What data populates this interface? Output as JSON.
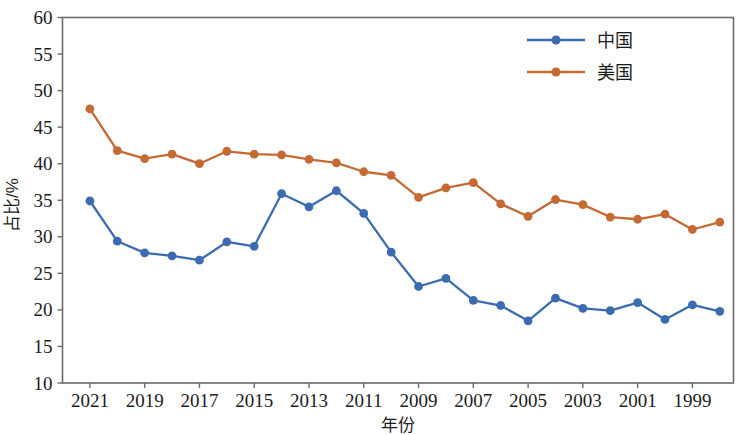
{
  "chart_data": {
    "type": "line",
    "title": "",
    "xlabel": "年份",
    "ylabel": "占比/%",
    "xlim": [
      2022,
      1997.5
    ],
    "ylim": [
      10,
      60
    ],
    "x_reversed": true,
    "grid": false,
    "legend_position": "top-right",
    "y_ticks": [
      60,
      55,
      50,
      45,
      40,
      35,
      30,
      25,
      20,
      15,
      10
    ],
    "x_ticks": [
      2021,
      2019,
      2017,
      2015,
      2013,
      2011,
      2009,
      2007,
      2005,
      2003,
      2001,
      1999
    ],
    "x": [
      2021,
      2020,
      2019,
      2018,
      2017,
      2016,
      2015,
      2014,
      2013,
      2012,
      2011,
      2010,
      2009,
      2008,
      2007,
      2006,
      2005,
      2004,
      2003,
      2002,
      2001,
      2000,
      1999,
      1998
    ],
    "series": [
      {
        "name": "中国",
        "color": "#3c6cb0",
        "marker": "circle",
        "values": [
          34.9,
          29.4,
          27.8,
          27.4,
          26.8,
          29.3,
          28.7,
          35.9,
          34.1,
          36.3,
          33.2,
          27.9,
          23.2,
          24.3,
          21.3,
          20.6,
          18.5,
          21.6,
          20.2,
          19.9,
          21.0,
          18.7,
          20.7,
          19.8
        ]
      },
      {
        "name": "美国",
        "color": "#c46a35",
        "marker": "circle",
        "values": [
          47.5,
          41.8,
          40.7,
          41.3,
          40.0,
          41.7,
          41.3,
          41.2,
          40.6,
          40.1,
          38.9,
          38.4,
          35.4,
          36.7,
          37.4,
          34.5,
          32.8,
          35.1,
          34.4,
          32.7,
          32.4,
          33.1,
          31.0,
          32.0
        ]
      }
    ]
  },
  "legend": {
    "items": [
      {
        "label": "中国",
        "color": "#3c6cb0"
      },
      {
        "label": "美国",
        "color": "#c46a35"
      }
    ]
  },
  "axes": {
    "y_title": "占比/%",
    "x_title": "年份"
  }
}
